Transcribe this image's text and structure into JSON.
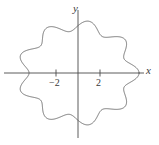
{
  "figure": {
    "kind": "cartesian-plot",
    "background_color": "#ffffff",
    "curve_color": "#5a5a5a",
    "axis_color": "#4a4a4a",
    "text_color": "#3a3a3a"
  },
  "axes": {
    "x_label": "x",
    "y_label": "y",
    "origin_px": {
      "x": 78,
      "y": 73
    },
    "unit_px": {
      "x": 11.0,
      "y": 11.0
    },
    "x_ticks": [
      {
        "value": -2,
        "label": "−2"
      },
      {
        "value": 2,
        "label": "2"
      }
    ],
    "y_ticks": [],
    "x_range_px": [
      4,
      145
    ],
    "y_range_px": [
      10,
      138
    ],
    "grid": false
  },
  "chart_data": {
    "type": "line",
    "title": "",
    "xlabel": "x",
    "ylabel": "y",
    "grid": false,
    "legend": null,
    "xlim": [
      -6.4,
      6.1
    ],
    "ylim": [
      -5.7,
      5.7
    ],
    "x_tick_values": [
      -2,
      2
    ],
    "x_tick_labels": [
      "−2",
      "2"
    ],
    "y_tick_values": [],
    "y_tick_labels": [],
    "series": [
      {
        "name": "lissajous-rose",
        "description": "closed self-intersecting curve with ten outer lobes, drawn as a single continuous path",
        "parametric": {
          "t_start": 0,
          "t_end": 6.283185307,
          "x": "(5.0 + 0.55*cos(9*t)) * cos(t)",
          "y": "(4.3 + 0.48*cos(9*t)) * sin(t)"
        },
        "lobe_count": 10,
        "outer_radius_x": 5.55,
        "outer_radius_y": 4.78,
        "inner_radius_x": 4.45,
        "inner_radius_y": 3.82
      }
    ]
  }
}
